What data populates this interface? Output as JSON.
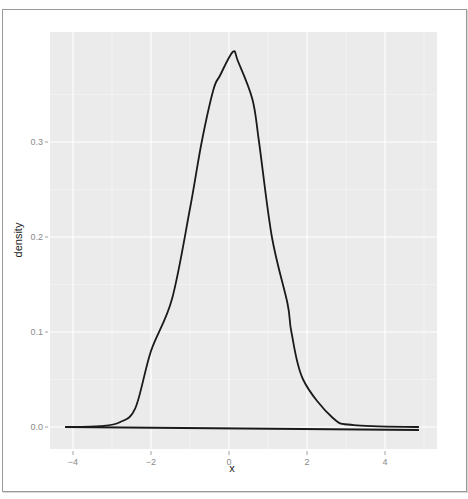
{
  "chart_data": {
    "type": "line",
    "title": "",
    "xlabel": "x",
    "ylabel": "density",
    "xlim": [
      -4.6,
      5.3
    ],
    "ylim": [
      -0.023,
      0.415
    ],
    "x_ticks": [
      -4,
      -2,
      0,
      2,
      4
    ],
    "x_tick_labels": [
      "-4",
      "-2",
      "0",
      "2",
      "4"
    ],
    "y_ticks": [
      0.0,
      0.1,
      0.2,
      0.3
    ],
    "y_tick_labels": [
      "0.0",
      "0.1",
      "0.2",
      "0.3"
    ],
    "grid": true,
    "legend": null,
    "series": [
      {
        "name": "density",
        "color": "#1a1a1a",
        "x": [
          -4.2,
          -3.3,
          -2.8,
          -2.4,
          -2.0,
          -1.46,
          -1.0,
          -0.7,
          -0.4,
          -0.23,
          0.1,
          0.23,
          0.6,
          0.77,
          1.1,
          1.5,
          1.6,
          1.9,
          2.65,
          3.2,
          4.87
        ],
        "y": [
          0.0,
          0.001,
          0.005,
          0.02,
          0.08,
          0.135,
          0.23,
          0.3,
          0.355,
          0.37,
          0.395,
          0.385,
          0.345,
          0.3,
          0.2,
          0.13,
          0.1,
          0.05,
          0.01,
          0.002,
          0.0
        ]
      }
    ],
    "baseline": {
      "x": [
        -4.2,
        4.87
      ],
      "y": [
        0.0,
        0.0
      ]
    }
  },
  "axes": {
    "x_title": "x",
    "y_title": "density",
    "x_tick_labels": [
      "-4",
      "-2",
      "0",
      "2",
      "4"
    ],
    "y_tick_labels": [
      "0.0",
      "0.1",
      "0.2",
      "0.3"
    ]
  },
  "colors": {
    "panel_background": "#ebebeb",
    "grid_major": "#ffffff",
    "line": "#1a1a1a"
  }
}
